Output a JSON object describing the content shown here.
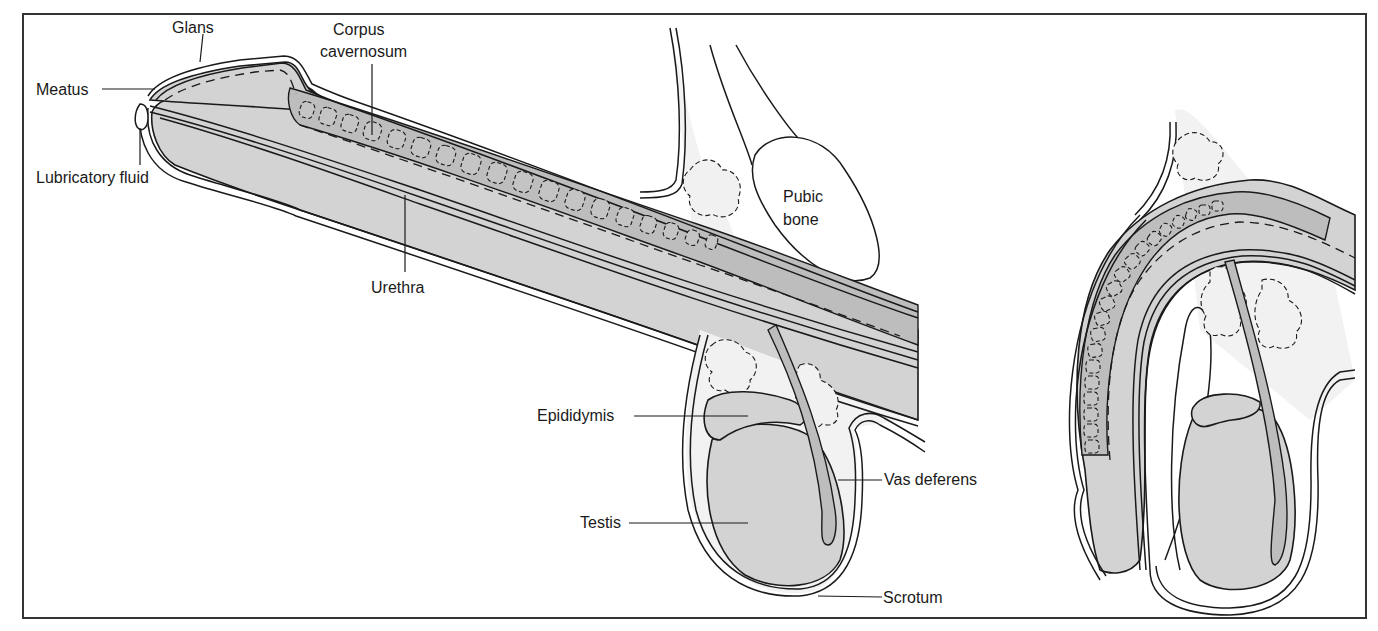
{
  "figure": {
    "colors": {
      "tissue": "#d3d3d3",
      "tissue_dark": "#bdbdbd",
      "line": "#1a1a1a",
      "background": "#ffffff"
    },
    "panels": [
      {
        "id": "erect",
        "description": "Side view, erect state"
      },
      {
        "id": "flaccid",
        "description": "Side view, flaccid state"
      }
    ]
  },
  "labels": {
    "glans": "Glans",
    "corpus_line1": "Corpus",
    "corpus_line2": "cavernosum",
    "meatus": "Meatus",
    "lubricatory_fluid": "Lubricatory fluid",
    "urethra": "Urethra",
    "pubic_line1": "Pubic",
    "pubic_line2": "bone",
    "epididymis": "Epididymis",
    "vas_deferens": "Vas deferens",
    "testis": "Testis",
    "scrotum": "Scrotum"
  }
}
